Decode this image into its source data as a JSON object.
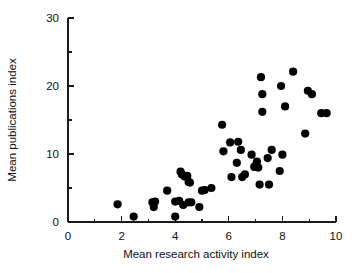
{
  "chart_data": {
    "type": "scatter",
    "title": "",
    "xlabel": "Mean research activity index",
    "ylabel": "Mean publications index",
    "xlim": [
      0,
      10
    ],
    "ylim": [
      0,
      30
    ],
    "xticks": [
      0,
      2,
      4,
      6,
      8,
      10
    ],
    "xtick_labels": [
      "0",
      "2",
      "4",
      "6",
      "8",
      "10"
    ],
    "xticks_minor": [
      1,
      3,
      5,
      7,
      9
    ],
    "yticks": [
      0,
      10,
      20,
      30
    ],
    "ytick_labels": [
      "0",
      "10",
      "20",
      "30"
    ],
    "yticks_minor": [
      5,
      15,
      25
    ],
    "grid": false,
    "legend": null,
    "marker": "filled-circle",
    "marker_color": "#000000",
    "marker_size": 5,
    "points": [
      [
        1.85,
        2.6
      ],
      [
        2.45,
        0.8
      ],
      [
        3.15,
        2.9
      ],
      [
        3.25,
        3.0
      ],
      [
        3.2,
        2.2
      ],
      [
        3.7,
        4.6
      ],
      [
        4.0,
        0.8
      ],
      [
        4.0,
        3.0
      ],
      [
        4.15,
        3.1
      ],
      [
        4.2,
        7.4
      ],
      [
        4.25,
        7.0
      ],
      [
        4.3,
        2.5
      ],
      [
        4.35,
        6.7
      ],
      [
        4.45,
        6.8
      ],
      [
        4.5,
        2.9
      ],
      [
        4.5,
        5.9
      ],
      [
        4.55,
        5.8
      ],
      [
        4.6,
        2.9
      ],
      [
        4.9,
        2.2
      ],
      [
        5.0,
        4.6
      ],
      [
        5.1,
        4.7
      ],
      [
        5.35,
        5.0
      ],
      [
        5.75,
        14.3
      ],
      [
        5.8,
        10.4
      ],
      [
        6.05,
        11.7
      ],
      [
        6.1,
        6.6
      ],
      [
        6.3,
        8.7
      ],
      [
        6.35,
        11.8
      ],
      [
        6.45,
        10.6
      ],
      [
        6.5,
        6.6
      ],
      [
        6.6,
        7.0
      ],
      [
        6.85,
        9.9
      ],
      [
        6.95,
        8.1
      ],
      [
        7.0,
        8.3
      ],
      [
        7.05,
        8.9
      ],
      [
        7.1,
        8.0
      ],
      [
        7.15,
        5.5
      ],
      [
        7.2,
        21.3
      ],
      [
        7.25,
        16.2
      ],
      [
        7.25,
        18.8
      ],
      [
        7.45,
        9.4
      ],
      [
        7.5,
        5.5
      ],
      [
        7.6,
        10.6
      ],
      [
        7.9,
        7.5
      ],
      [
        7.95,
        20.0
      ],
      [
        8.0,
        9.9
      ],
      [
        8.1,
        17.0
      ],
      [
        8.4,
        22.1
      ],
      [
        8.85,
        13.0
      ],
      [
        8.95,
        19.3
      ],
      [
        9.1,
        18.8
      ],
      [
        9.45,
        16.0
      ],
      [
        9.65,
        16.0
      ]
    ]
  }
}
